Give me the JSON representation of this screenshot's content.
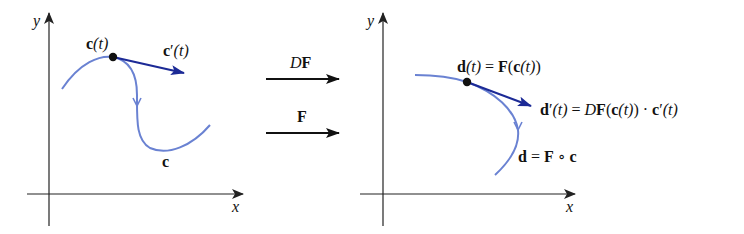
{
  "figure": {
    "colors": {
      "curve": "#6a82d2",
      "velocity_arrow": "#1c2a96",
      "axis": "#222222",
      "point": "#111111"
    },
    "left_panel": {
      "axis_x_label": "x",
      "axis_y_label": "y",
      "point_label_main": "c",
      "point_label_arg": "(t)",
      "velocity_label_main": "c",
      "velocity_label_prime": "′",
      "velocity_label_arg": "(t)",
      "curve_label": "c"
    },
    "middle": {
      "top_arrow_label_italic": "D",
      "top_arrow_label_bold": "F",
      "bottom_arrow_label": "F"
    },
    "right_panel": {
      "axis_x_label": "x",
      "axis_y_label": "y",
      "point_label": {
        "d": "d",
        "t1": "(t)",
        "eq": " = ",
        "F": "F",
        "open": "(",
        "c": "c",
        "t2": "(t)",
        "close": ")"
      },
      "velocity_label": {
        "d": "d",
        "prime": "′",
        "t1": "(t)",
        "eq": " = ",
        "D": "D",
        "F": "F",
        "open": "(",
        "c": "c",
        "t2": "(t)",
        "close": ")",
        "dot": " · ",
        "c2": "c",
        "prime2": "′",
        "t3": "(t)"
      },
      "curve_label": {
        "d": "d",
        "eq": " = ",
        "F": "F",
        "comp": " ∘ ",
        "c": "c"
      }
    }
  }
}
